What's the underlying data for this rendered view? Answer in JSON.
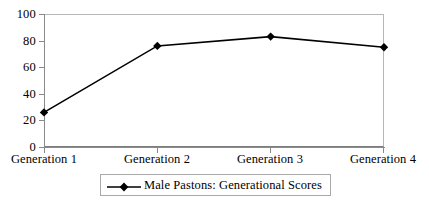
{
  "chart_data": {
    "type": "line",
    "title": "",
    "subtitle": "",
    "xlabel": "",
    "ylabel": "",
    "categories": [
      "Generation 1",
      "Generation 2",
      "Generation 3",
      "Generation 4"
    ],
    "series": [
      {
        "name": "Male Pastons: Generational Scores",
        "values": [
          26,
          76,
          83,
          75
        ],
        "marker": "diamond",
        "color": "#000000",
        "line_color": "#000000"
      }
    ],
    "ylim": [
      0,
      100
    ],
    "yticks": [
      0,
      20,
      40,
      60,
      80,
      100
    ],
    "ytick_labels": [
      "0",
      "20",
      "40",
      "60",
      "80",
      "100"
    ],
    "grid": false,
    "legend_position": "bottom-center",
    "plot_border_color": "#b6b6b6",
    "axis_color": "#8a8a8a",
    "background_color": "#ffffff"
  },
  "legend": {
    "entries": [
      {
        "label": "Male Pastons: Generational Scores",
        "marker": "diamond-marker"
      }
    ]
  },
  "axes": {
    "y": {
      "labels": [
        "100",
        "80",
        "60",
        "40",
        "20",
        "0"
      ]
    },
    "x": {
      "labels": [
        "Generation 1",
        "Generation 2",
        "Generation 3",
        "Generation 4"
      ]
    }
  }
}
